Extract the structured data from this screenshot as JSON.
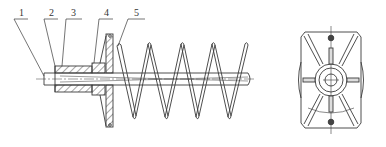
{
  "figure": {
    "type": "technical drawing",
    "views": [
      "side-section-view",
      "end-view"
    ],
    "line_color": "#3a3a3a",
    "background": "#ffffff"
  },
  "labels": [
    {
      "id": "1",
      "text": "1"
    },
    {
      "id": "2",
      "text": "2"
    },
    {
      "id": "3",
      "text": "3"
    },
    {
      "id": "4",
      "text": "4"
    },
    {
      "id": "5",
      "text": "5"
    }
  ]
}
